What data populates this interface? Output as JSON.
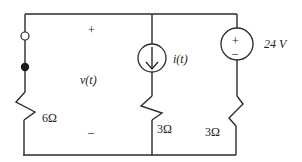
{
  "diagram": {
    "type": "circuit",
    "polarity": {
      "plus": "+",
      "minus": "–"
    },
    "voltage_label": "v(t)",
    "branches": [
      {
        "name": "left",
        "components": [
          {
            "type": "terminal",
            "style": "open"
          },
          {
            "type": "terminal",
            "style": "filled"
          },
          {
            "type": "resistor",
            "label": "6Ω"
          }
        ]
      },
      {
        "name": "middle",
        "components": [
          {
            "type": "current-source",
            "direction": "down",
            "label": "i(t)"
          },
          {
            "type": "resistor",
            "label": "3Ω"
          }
        ]
      },
      {
        "name": "right",
        "components": [
          {
            "type": "voltage-source",
            "label": "24 V",
            "plus": "+",
            "minus": "–"
          },
          {
            "type": "resistor",
            "label": "3Ω"
          }
        ]
      }
    ]
  }
}
